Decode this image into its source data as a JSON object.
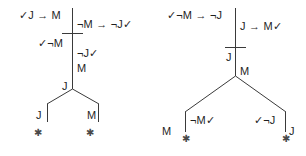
{
  "figure": {
    "type": "truth-tree-proof-diagram",
    "background_color": "#ffffff",
    "ink_color": "#1f1f1f",
    "glyphs": {
      "check": "✓",
      "arrow": "→",
      "negation": "¬",
      "closed_branch": "✱"
    }
  },
  "left_tree": {
    "name": "left-proof-tree",
    "nodes": [
      {
        "id": "l1",
        "text": "✓J → M",
        "side": "left"
      },
      {
        "id": "l2",
        "text": "¬M → ¬J✓",
        "side": "right"
      },
      {
        "id": "l3",
        "text": "✓¬M",
        "side": "left"
      },
      {
        "id": "l4",
        "text": "¬J✓",
        "side": "right"
      },
      {
        "id": "l5",
        "text": "M",
        "side": "right"
      },
      {
        "id": "l6",
        "text": "J",
        "side": "left"
      }
    ],
    "branches": [
      {
        "id": "lb-left",
        "text": "J",
        "close_mark": "✱"
      },
      {
        "id": "lb-right",
        "text": "M",
        "close_mark": "✱"
      }
    ]
  },
  "right_tree": {
    "name": "right-proof-tree",
    "nodes": [
      {
        "id": "r1",
        "text": "✓¬M → ¬J",
        "side": "left"
      },
      {
        "id": "r2",
        "text": "J → M✓",
        "side": "right"
      },
      {
        "id": "r3",
        "text": "J",
        "side": "left"
      },
      {
        "id": "r4",
        "text": "M",
        "side": "right"
      }
    ],
    "branches": [
      {
        "id": "rb-left",
        "text_left": "M",
        "text_right": "¬M✓",
        "close_mark": "✱"
      },
      {
        "id": "rb-right",
        "text_left": "✓¬J",
        "text_right": "J",
        "close_mark": "✱"
      }
    ]
  }
}
